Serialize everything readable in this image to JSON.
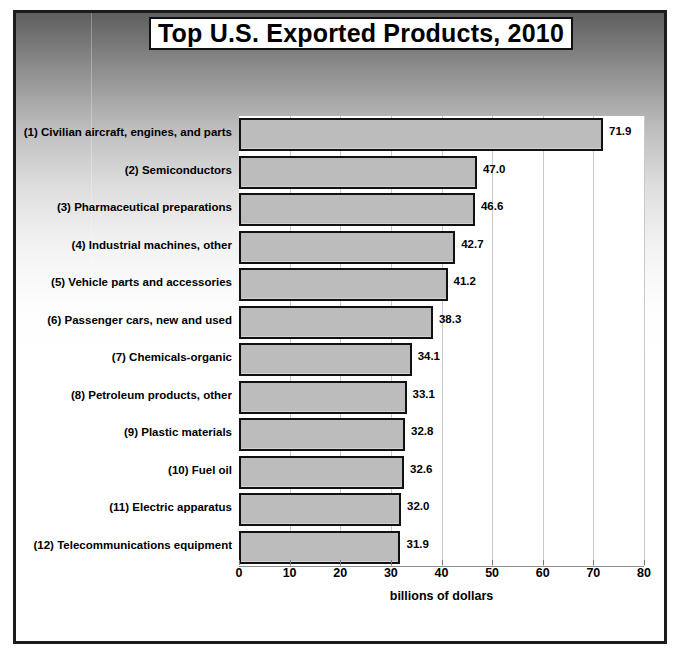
{
  "chart_data": {
    "type": "bar",
    "orientation": "horizontal",
    "title": "Top U.S. Exported Products, 2010",
    "xlabel": "billions of dollars",
    "ylabel": "",
    "xlim": [
      0,
      80
    ],
    "xticks": [
      0,
      10,
      20,
      30,
      40,
      50,
      60,
      70,
      80
    ],
    "xtick_labels": [
      "0",
      "10",
      "20",
      "30",
      "40",
      "50",
      "60",
      "70",
      "80"
    ],
    "grid": true,
    "legend": false,
    "categories": [
      "(1) Civilian aircraft, engines, and parts",
      "(2) Semiconductors",
      "(3) Pharmaceutical preparations",
      "(4) Industrial machines, other",
      "(5) Vehicle parts and accessories",
      "(6) Passenger cars, new and used",
      "(7) Chemicals-organic",
      "(8) Petroleum products, other",
      "(9) Plastic materials",
      "(10) Fuel oil",
      "(11) Electric apparatus",
      "(12) Telecommunications equipment"
    ],
    "values": [
      71.9,
      47.0,
      46.6,
      42.7,
      41.2,
      38.3,
      34.1,
      33.1,
      32.8,
      32.6,
      32.0,
      31.9
    ],
    "value_labels": [
      "71.9",
      "47.0",
      "46.6",
      "42.7",
      "41.2",
      "38.3",
      "34.1",
      "33.1",
      "32.8",
      "32.6",
      "32.0",
      "31.9"
    ],
    "bar_fill_color": "#bcbcbc",
    "bar_edge_color": "#111111",
    "plot_background_color": "#ffffff",
    "gridline_color": "#c9c9c9"
  }
}
